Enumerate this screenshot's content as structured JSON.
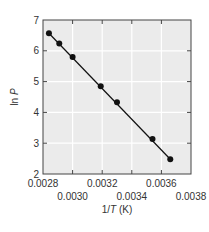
{
  "chart_data": {
    "type": "line",
    "title": "",
    "xlabel_parts": {
      "prefix": "1/",
      "italic": "T",
      "suffix": " (K)"
    },
    "xlabel": "1/T (K)",
    "ylabel_parts": {
      "prefix": "ln ",
      "italic": "P"
    },
    "ylabel": "ln P",
    "xlim": [
      0.0028,
      0.0038
    ],
    "ylim": [
      2,
      7
    ],
    "x_ticks": [
      "0.0028",
      "0.0030",
      "0.0032",
      "0.0034",
      "0.0036",
      "0.0038"
    ],
    "x_tick_values": [
      0.0028,
      0.003,
      0.0032,
      0.0034,
      0.0036,
      0.0038
    ],
    "y_ticks": [
      "2",
      "3",
      "4",
      "5",
      "6",
      "7"
    ],
    "y_tick_values": [
      2,
      3,
      4,
      5,
      6,
      7
    ],
    "grid": true,
    "legend": null,
    "series": [
      {
        "name": "ln P vs 1/T",
        "x": [
          0.00284,
          0.00291,
          0.003,
          0.00319,
          0.0033,
          0.00354,
          0.00366
        ],
        "y": [
          6.57,
          6.24,
          5.8,
          4.85,
          4.33,
          3.14,
          2.48
        ],
        "markers": true,
        "line": "fit"
      }
    ]
  },
  "colors": {
    "plot_background": "#ebebeb",
    "grid": "#ffffff",
    "axis": "#444444",
    "series": "#111111"
  }
}
